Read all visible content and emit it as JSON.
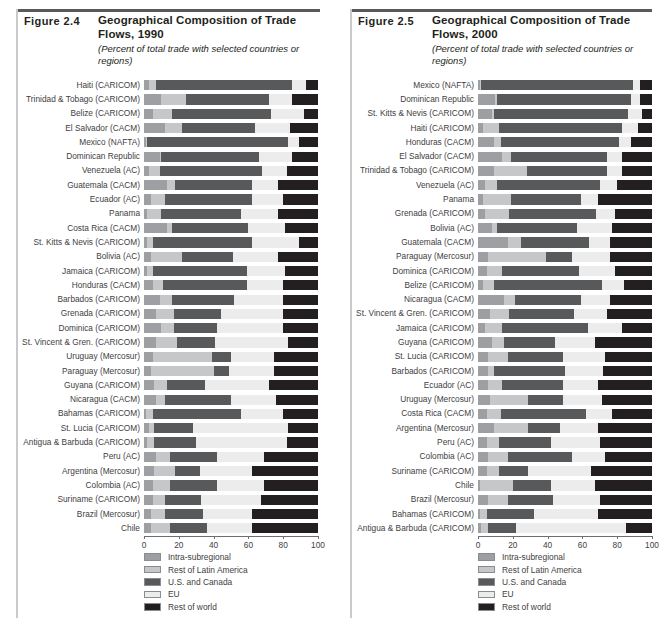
{
  "figures": [
    {
      "number": "Figure 2.4",
      "title": "Geographical Composition of Trade Flows, 1990",
      "subtitle": "(Percent of total trade with selected countries or regions)",
      "axis": {
        "ticks": [
          "0",
          "20",
          "40",
          "60",
          "80",
          "100"
        ],
        "min": 0,
        "max": 100
      }
    },
    {
      "number": "Figure 2.5",
      "title": "Geographical Composition of Trade Flows, 2000",
      "subtitle": "(Percent of total trade with selected countries or regions)",
      "axis": {
        "ticks": [
          "0",
          "20",
          "40",
          "60",
          "80",
          "100"
        ],
        "min": 0,
        "max": 100
      }
    }
  ],
  "legend": {
    "items": [
      {
        "label": "Intra-subregional",
        "color": "#9d9fa2"
      },
      {
        "label": "Rest of Latin America",
        "color": "#c6c7c9"
      },
      {
        "label": "U.S. and Canada",
        "color": "#58595b"
      },
      {
        "label": "EU",
        "color": "#ececec"
      },
      {
        "label": "Rest of world",
        "color": "#231f20"
      }
    ]
  },
  "chart_data": [
    {
      "type": "bar",
      "orientation": "horizontal",
      "stacked": true,
      "percent": true,
      "title": "Geographical Composition of Trade Flows, 1990",
      "subtitle": "(Percent of total trade with selected countries or regions)",
      "xlabel": "",
      "ylabel": "",
      "xlim": [
        0,
        100
      ],
      "xticks": [
        0,
        20,
        40,
        60,
        80,
        100
      ],
      "grid": false,
      "legend_position": "bottom",
      "series": [
        {
          "name": "Intra-subregional",
          "color": "#9d9fa2"
        },
        {
          "name": "Rest of Latin America",
          "color": "#c6c7c9"
        },
        {
          "name": "U.S. and Canada",
          "color": "#58595b"
        },
        {
          "name": "EU",
          "color": "#ececec"
        },
        {
          "name": "Rest of world",
          "color": "#231f20"
        }
      ],
      "categories": [
        "Haiti (CARICOM)",
        "Trinidad & Tobago (CARICOM)",
        "Belize (CARICOM)",
        "El Salvador (CACM)",
        "Mexico (NAFTA)",
        "Dominican Republic",
        "Venezuela (AC)",
        "Guatemala (CACM)",
        "Ecuador (AC)",
        "Panama",
        "Costa Rica (CACM)",
        "St. Kitts & Nevis (CARICOM)",
        "Bolivia (AC)",
        "Jamaica (CARICOM)",
        "Honduras (CACM)",
        "Barbados (CARICOM)",
        "Grenada (CARICOM)",
        "Dominica (CARICOM)",
        "St. Vincent & Gren. (CARICOM)",
        "Uruguay (Mercosur)",
        "Paraguay (Mercosur)",
        "Guyana (CARICOM)",
        "Nicaragua (CACM)",
        "Bahamas (CARICOM)",
        "St. Lucia (CARICOM)",
        "Antigua & Barbuda (CARICOM)",
        "Peru (AC)",
        "Argentina (Mercosur)",
        "Colombia (AC)",
        "Suriname (CARICOM)",
        "Brazil (Mercosur)",
        "Chile"
      ],
      "values": [
        [
          3,
          4,
          78,
          8,
          7
        ],
        [
          10,
          14,
          48,
          13,
          15
        ],
        [
          5,
          11,
          57,
          19,
          8
        ],
        [
          12,
          10,
          42,
          20,
          16
        ],
        [
          1,
          1,
          81,
          6,
          11
        ],
        [
          9,
          1,
          56,
          19,
          15
        ],
        [
          3,
          6,
          59,
          14,
          18
        ],
        [
          13,
          5,
          44,
          15,
          23
        ],
        [
          4,
          8,
          50,
          18,
          20
        ],
        [
          2,
          8,
          46,
          21,
          23
        ],
        [
          13,
          3,
          44,
          21,
          19
        ],
        [
          2,
          3,
          57,
          27,
          11
        ],
        [
          4,
          18,
          29,
          26,
          23
        ],
        [
          2,
          3,
          54,
          22,
          19
        ],
        [
          5,
          6,
          48,
          21,
          20
        ],
        [
          9,
          7,
          36,
          28,
          20
        ],
        [
          7,
          10,
          27,
          36,
          20
        ],
        [
          10,
          7,
          25,
          38,
          20
        ],
        [
          7,
          12,
          22,
          42,
          17
        ],
        [
          5,
          34,
          11,
          25,
          25
        ],
        [
          4,
          36,
          9,
          26,
          25
        ],
        [
          6,
          7,
          22,
          37,
          28
        ],
        [
          7,
          5,
          38,
          26,
          24
        ],
        [
          1,
          4,
          51,
          24,
          20
        ],
        [
          3,
          3,
          22,
          55,
          17
        ],
        [
          2,
          4,
          24,
          52,
          18
        ],
        [
          7,
          8,
          27,
          27,
          31
        ],
        [
          6,
          12,
          14,
          30,
          38
        ],
        [
          5,
          10,
          27,
          27,
          31
        ],
        [
          5,
          7,
          21,
          34,
          33
        ],
        [
          4,
          8,
          22,
          28,
          38
        ],
        [
          4,
          11,
          21,
          26,
          38
        ]
      ]
    },
    {
      "type": "bar",
      "orientation": "horizontal",
      "stacked": true,
      "percent": true,
      "title": "Geographical Composition of Trade Flows, 2000",
      "subtitle": "(Percent of total trade with selected countries or regions)",
      "xlabel": "",
      "ylabel": "",
      "xlim": [
        0,
        100
      ],
      "xticks": [
        0,
        20,
        40,
        60,
        80,
        100
      ],
      "grid": false,
      "legend_position": "bottom",
      "series": [
        {
          "name": "Intra-subregional",
          "color": "#9d9fa2"
        },
        {
          "name": "Rest of Latin America",
          "color": "#c6c7c9"
        },
        {
          "name": "U.S. and Canada",
          "color": "#58595b"
        },
        {
          "name": "EU",
          "color": "#ececec"
        },
        {
          "name": "Rest of world",
          "color": "#231f20"
        }
      ],
      "categories": [
        "Mexico (NAFTA)",
        "Dominican Republic",
        "St. Kitts & Nevis (CARICOM)",
        "Haiti (CARICOM)",
        "Honduras (CACM)",
        "El Salvador (CACM)",
        "Trinidad & Tobago (CARICOM)",
        "Venezuela (AC)",
        "Panama",
        "Grenada (CARICOM)",
        "Bolivia (AC)",
        "Guatemala (CACM)",
        "Paraguay (Mercosur)",
        "Dominica (CARICOM)",
        "Belize (CARICOM)",
        "Nicaragua (CACM)",
        "St. Vincent & Gren. (CARICOM)",
        "Jamaica (CARICOM)",
        "Guyana (CARICOM)",
        "St. Lucia (CARICOM)",
        "Barbados (CARICOM)",
        "Ecuador (AC)",
        "Uruguay (Mercosur)",
        "Costa Rica (CACM)",
        "Argentina (Mercosur)",
        "Peru (AC)",
        "Colombia (AC)",
        "Suriname (CARICOM)",
        "Chile",
        "Brazil (Mercosur)",
        "Bahamas (CARICOM)",
        "Antigua & Barbuda (CARICOM)"
      ],
      "values": [
        [
          1,
          1,
          87,
          4,
          7
        ],
        [
          10,
          1,
          77,
          5,
          7
        ],
        [
          8,
          1,
          77,
          8,
          6
        ],
        [
          3,
          9,
          71,
          9,
          8
        ],
        [
          9,
          4,
          68,
          7,
          12
        ],
        [
          14,
          5,
          55,
          9,
          17
        ],
        [
          9,
          19,
          46,
          9,
          17
        ],
        [
          4,
          7,
          59,
          10,
          20
        ],
        [
          3,
          16,
          40,
          10,
          31
        ],
        [
          4,
          14,
          50,
          11,
          21
        ],
        [
          8,
          3,
          46,
          20,
          23
        ],
        [
          17,
          8,
          39,
          12,
          24
        ],
        [
          6,
          33,
          15,
          22,
          24
        ],
        [
          5,
          9,
          44,
          21,
          21
        ],
        [
          3,
          6,
          62,
          13,
          16
        ],
        [
          15,
          6,
          38,
          17,
          24
        ],
        [
          7,
          11,
          37,
          19,
          26
        ],
        [
          4,
          10,
          49,
          20,
          17
        ],
        [
          8,
          7,
          29,
          23,
          33
        ],
        [
          6,
          11,
          32,
          24,
          27
        ],
        [
          6,
          3,
          41,
          22,
          28
        ],
        [
          6,
          8,
          35,
          20,
          31
        ],
        [
          7,
          22,
          20,
          22,
          29
        ],
        [
          5,
          8,
          49,
          15,
          23
        ],
        [
          9,
          20,
          18,
          22,
          31
        ],
        [
          5,
          7,
          30,
          28,
          30
        ],
        [
          6,
          11,
          37,
          19,
          27
        ],
        [
          5,
          7,
          17,
          36,
          35
        ],
        [
          1,
          19,
          22,
          25,
          33
        ],
        [
          6,
          11,
          26,
          27,
          30
        ],
        [
          1,
          4,
          27,
          37,
          31
        ],
        [
          2,
          4,
          16,
          63,
          15
        ]
      ]
    }
  ]
}
